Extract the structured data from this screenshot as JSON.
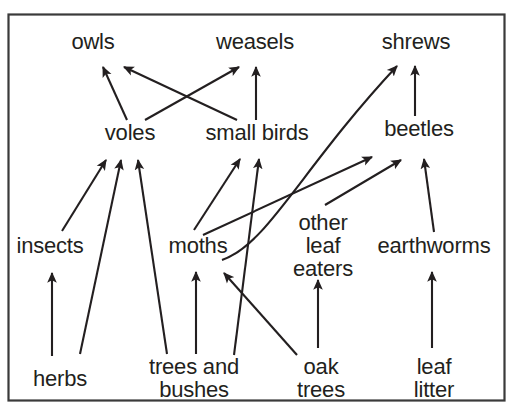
{
  "diagram": {
    "type": "food-web",
    "background_color": "#ffffff",
    "ink_color": "#231f20",
    "frame": {
      "border_color": "#3a3a3a",
      "x": 8,
      "y": 14,
      "width": 497,
      "height": 387
    },
    "nodes": [
      {
        "id": "owls",
        "label": "owls",
        "x": 93,
        "y": 43,
        "trophic": "predator"
      },
      {
        "id": "weasels",
        "label": "weasels",
        "x": 255,
        "y": 43,
        "trophic": "predator"
      },
      {
        "id": "shrews",
        "label": "shrews",
        "x": 416,
        "y": 43,
        "trophic": "predator"
      },
      {
        "id": "voles",
        "label": "voles",
        "x": 130,
        "y": 134,
        "trophic": "herbivore"
      },
      {
        "id": "small_birds",
        "label": "small birds",
        "x": 257,
        "y": 134,
        "trophic": "insectivore"
      },
      {
        "id": "beetles",
        "label": "beetles",
        "x": 419,
        "y": 130,
        "trophic": "invertebrate"
      },
      {
        "id": "insects",
        "label": "insects",
        "x": 50,
        "y": 248,
        "trophic": "invertebrate"
      },
      {
        "id": "moths",
        "label": "moths",
        "x": 198,
        "y": 248,
        "trophic": "invertebrate"
      },
      {
        "id": "other_leaf_eaters",
        "label": "other\nleaf\neaters",
        "x": 323,
        "y": 225,
        "trophic": "invertebrate"
      },
      {
        "id": "earthworms",
        "label": "earthworms",
        "x": 434,
        "y": 248,
        "trophic": "decomposer"
      },
      {
        "id": "herbs",
        "label": "herbs",
        "x": 60,
        "y": 381,
        "trophic": "producer"
      },
      {
        "id": "trees_bushes",
        "label": "trees and\nbushes",
        "x": 194,
        "y": 369,
        "trophic": "producer"
      },
      {
        "id": "oak_trees",
        "label": "oak\ntrees",
        "x": 321,
        "y": 369,
        "trophic": "producer"
      },
      {
        "id": "leaf_litter",
        "label": "leaf\nlitter",
        "x": 434,
        "y": 369,
        "trophic": "detritus"
      }
    ],
    "links": [
      {
        "from": "voles",
        "to": "owls",
        "style": "straight"
      },
      {
        "from": "small_birds",
        "to": "owls",
        "style": "straight"
      },
      {
        "from": "voles",
        "to": "weasels",
        "style": "straight"
      },
      {
        "from": "small_birds",
        "to": "weasels",
        "style": "straight"
      },
      {
        "from": "moths",
        "to": "shrews",
        "style": "curved"
      },
      {
        "from": "beetles",
        "to": "shrews",
        "style": "straight"
      },
      {
        "from": "insects",
        "to": "voles",
        "style": "straight"
      },
      {
        "from": "herbs",
        "to": "voles",
        "style": "straight"
      },
      {
        "from": "trees_bushes",
        "to": "voles",
        "style": "straight"
      },
      {
        "from": "moths",
        "to": "small_birds",
        "style": "straight"
      },
      {
        "from": "trees_bushes",
        "to": "small_birds",
        "style": "straight"
      },
      {
        "from": "moths",
        "to": "beetles",
        "style": "straight"
      },
      {
        "from": "other_leaf_eaters",
        "to": "beetles",
        "style": "straight"
      },
      {
        "from": "earthworms",
        "to": "beetles",
        "style": "straight"
      },
      {
        "from": "herbs",
        "to": "insects",
        "style": "straight"
      },
      {
        "from": "trees_bushes",
        "to": "moths",
        "style": "straight"
      },
      {
        "from": "oak_trees",
        "to": "moths",
        "style": "straight"
      },
      {
        "from": "oak_trees",
        "to": "other_leaf_eaters",
        "style": "straight"
      },
      {
        "from": "leaf_litter",
        "to": "earthworms",
        "style": "straight"
      }
    ]
  }
}
